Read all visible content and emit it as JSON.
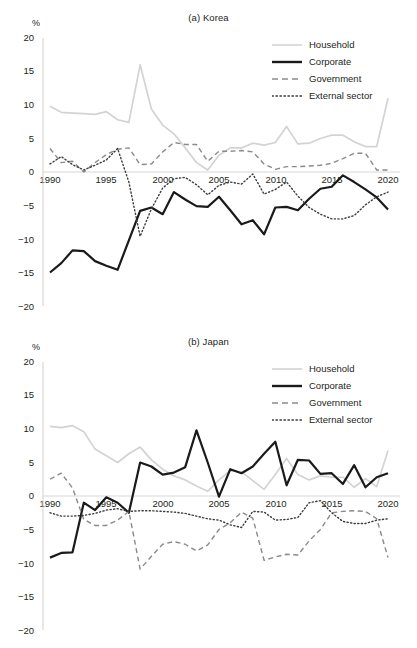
{
  "figure": {
    "unit_label": "%",
    "y_ticks": [
      "20",
      "15",
      "10",
      "5",
      "0",
      "−5",
      "−10",
      "−15",
      "−20"
    ],
    "x_ticks": [
      "1990",
      "1995",
      "2000",
      "2005",
      "2010",
      "2015",
      "2020"
    ],
    "legend": [
      {
        "label": "Household",
        "style": "solid-light",
        "color": "#d3d3d3"
      },
      {
        "label": "Corporate",
        "style": "solid-bold",
        "color": "#1a1a1a"
      },
      {
        "label": "Government",
        "style": "dashed",
        "color": "#8a8a8a"
      },
      {
        "label": "External sector",
        "style": "dotted",
        "color": "#3d3d3d"
      }
    ]
  },
  "chart_data": [
    {
      "type": "line",
      "title": "(a) Korea",
      "xlabel": "",
      "ylabel": "%",
      "ylim": [
        -20,
        20
      ],
      "xlim": [
        1990,
        2020
      ],
      "grid": false,
      "legend_position": "top-right",
      "x": [
        1990,
        1991,
        1992,
        1993,
        1994,
        1995,
        1996,
        1997,
        1998,
        1999,
        2000,
        2001,
        2002,
        2003,
        2004,
        2005,
        2006,
        2007,
        2008,
        2009,
        2010,
        2011,
        2012,
        2013,
        2014,
        2015,
        2016,
        2017,
        2018,
        2019,
        2020
      ],
      "series": [
        {
          "name": "Household",
          "color": "#d3d3d3",
          "values": [
            9.8,
            8.9,
            8.8,
            8.7,
            8.6,
            9.0,
            7.8,
            7.4,
            16.0,
            9.4,
            7.0,
            5.7,
            3.6,
            1.4,
            0.3,
            2.5,
            3.6,
            3.6,
            4.3,
            4.0,
            4.4,
            6.8,
            4.2,
            4.3,
            5.0,
            5.5,
            5.5,
            4.5,
            3.8,
            3.8,
            11.0
          ]
        },
        {
          "name": "Corporate",
          "color": "#1a1a1a",
          "values": [
            -15.0,
            -13.6,
            -11.7,
            -11.8,
            -13.3,
            -14.0,
            -14.6,
            -10.2,
            -5.8,
            -5.3,
            -6.3,
            -3.0,
            -4.1,
            -5.1,
            -5.2,
            -3.7,
            -5.7,
            -7.8,
            -7.2,
            -9.3,
            -5.3,
            -5.2,
            -5.7,
            -4.0,
            -2.5,
            -2.2,
            -0.5,
            -1.5,
            -2.6,
            -3.8,
            -5.6
          ]
        },
        {
          "name": "Government",
          "color": "#8a8a8a",
          "values": [
            3.5,
            1.4,
            1.6,
            0.0,
            1.4,
            2.6,
            3.4,
            3.6,
            1.1,
            1.2,
            3.0,
            4.4,
            4.1,
            4.1,
            1.6,
            3.1,
            3.1,
            3.2,
            3.0,
            1.2,
            0.4,
            0.8,
            0.8,
            0.9,
            1.0,
            1.3,
            2.0,
            2.8,
            2.8,
            0.3,
            0.3
          ]
        },
        {
          "name": "External sector",
          "color": "#3d3d3d",
          "values": [
            1.2,
            2.3,
            1.1,
            0.3,
            1.0,
            1.8,
            3.5,
            -1.5,
            -9.6,
            -5.5,
            -2.4,
            -1.0,
            -0.8,
            -1.9,
            -3.4,
            -2.0,
            -1.5,
            -1.8,
            -0.3,
            -3.3,
            -2.6,
            -1.5,
            -3.6,
            -5.3,
            -6.3,
            -7.0,
            -7.0,
            -6.5,
            -4.9,
            -3.7,
            -3.0
          ]
        }
      ]
    },
    {
      "type": "line",
      "title": "(b) Japan",
      "xlabel": "",
      "ylabel": "%",
      "ylim": [
        -20,
        20
      ],
      "xlim": [
        1990,
        2020
      ],
      "grid": false,
      "legend_position": "top-right",
      "x": [
        1990,
        1991,
        1992,
        1993,
        1994,
        1995,
        1996,
        1997,
        1998,
        1999,
        2000,
        2001,
        2002,
        2003,
        2004,
        2005,
        2006,
        2007,
        2008,
        2009,
        2010,
        2011,
        2012,
        2013,
        2014,
        2015,
        2016,
        2017,
        2018,
        2019,
        2020
      ],
      "series": [
        {
          "name": "Household",
          "color": "#d3d3d3",
          "values": [
            10.4,
            10.2,
            10.5,
            9.6,
            7.0,
            6.0,
            5.0,
            6.3,
            7.3,
            5.4,
            4.0,
            3.0,
            2.4,
            1.5,
            0.7,
            2.4,
            3.8,
            3.6,
            2.3,
            1.0,
            3.2,
            5.6,
            3.2,
            2.4,
            3.0,
            2.8,
            2.8,
            1.3,
            2.6,
            1.4,
            6.8
          ]
        },
        {
          "name": "Corporate",
          "color": "#1a1a1a",
          "values": [
            -9.2,
            -8.5,
            -8.4,
            -1.0,
            -2.1,
            -0.2,
            -1.0,
            -2.5,
            5.0,
            4.4,
            3.2,
            3.5,
            4.3,
            9.8,
            5.0,
            -0.1,
            4.0,
            3.4,
            4.4,
            6.3,
            8.1,
            1.6,
            5.4,
            5.3,
            3.3,
            3.4,
            1.8,
            4.6,
            1.3,
            2.8,
            3.4
          ]
        },
        {
          "name": "Government",
          "color": "#8a8a8a",
          "values": [
            2.5,
            3.4,
            1.2,
            -3.5,
            -4.4,
            -4.4,
            -3.6,
            -2.3,
            -10.9,
            -9.0,
            -7.2,
            -6.8,
            -7.2,
            -8.2,
            -7.3,
            -5.0,
            -4.0,
            -2.4,
            -3.3,
            -9.6,
            -9.1,
            -8.7,
            -8.8,
            -6.7,
            -5.0,
            -2.5,
            -2.3,
            -2.2,
            -2.3,
            -3.4,
            -9.2
          ]
        },
        {
          "name": "External sector",
          "color": "#3d3d3d",
          "values": [
            -2.5,
            -3.0,
            -3.0,
            -2.9,
            -2.6,
            -2.1,
            -1.9,
            -2.3,
            -2.2,
            -2.2,
            -2.3,
            -2.4,
            -2.6,
            -3.0,
            -3.4,
            -3.6,
            -4.3,
            -4.7,
            -2.3,
            -2.4,
            -3.6,
            -3.5,
            -3.2,
            -1.0,
            -0.7,
            -2.5,
            -3.8,
            -4.1,
            -4.1,
            -3.6,
            -3.4
          ]
        }
      ]
    }
  ]
}
